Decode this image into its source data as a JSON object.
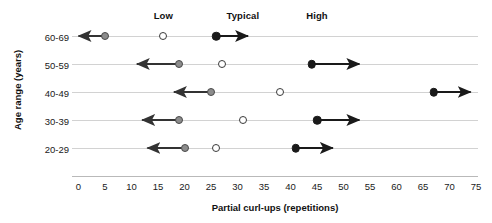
{
  "chart_data": {
    "type": "scatter",
    "title": "",
    "xlabel": "Partial curl-ups (repetitions)",
    "ylabel": "Age range (years)",
    "xlim": [
      0,
      75
    ],
    "xticks": [
      0,
      5,
      10,
      15,
      20,
      25,
      30,
      35,
      40,
      45,
      50,
      55,
      60,
      65,
      70,
      75
    ],
    "xtick_labels": [
      "0",
      "5",
      "10",
      "15",
      "20",
      "25",
      "30",
      "35",
      "40",
      "45",
      "50",
      "55",
      "60",
      "65",
      "70",
      "75"
    ],
    "categories": [
      "60-69",
      "50-59",
      "40-49",
      "30-39",
      "20-29"
    ],
    "grid": true,
    "legend_position": "top",
    "legend": [
      {
        "key": "low",
        "label": "Low",
        "marker": "filled-gray-circle",
        "arrow": "left",
        "color": "#8c8c8c"
      },
      {
        "key": "typical",
        "label": "Typical",
        "marker": "open-circle",
        "arrow": "none",
        "color": "#ffffff"
      },
      {
        "key": "high",
        "label": "High",
        "marker": "filled-black-circle",
        "arrow": "right",
        "color": "#1a1a1a"
      }
    ],
    "series": [
      {
        "name": "Low",
        "values": [
          5,
          19,
          25,
          19,
          20
        ]
      },
      {
        "name": "Typical",
        "values": [
          16,
          27,
          38,
          31,
          26
        ]
      },
      {
        "name": "High",
        "values": [
          26,
          44,
          67,
          45,
          41
        ]
      }
    ],
    "arrow_ends": {
      "low": [
        0,
        11,
        18,
        12,
        13
      ],
      "high": [
        32,
        53,
        74,
        53,
        48
      ]
    },
    "rows": [
      {
        "age": "60-69",
        "low": 5,
        "low_arrow_to": 0,
        "typical": 16,
        "high": 26,
        "high_arrow_to": 32
      },
      {
        "age": "50-59",
        "low": 19,
        "low_arrow_to": 11,
        "typical": 27,
        "high": 44,
        "high_arrow_to": 53
      },
      {
        "age": "40-49",
        "low": 25,
        "low_arrow_to": 18,
        "typical": 38,
        "high": 67,
        "high_arrow_to": 74
      },
      {
        "age": "30-39",
        "low": 19,
        "low_arrow_to": 12,
        "typical": 31,
        "high": 45,
        "high_arrow_to": 53
      },
      {
        "age": "20-29",
        "low": 20,
        "low_arrow_to": 13,
        "typical": 26,
        "high": 41,
        "high_arrow_to": 48
      }
    ],
    "legend_positions_x": {
      "low": 16,
      "typical": 31,
      "high": 45
    },
    "colors": {
      "low_fill": "#8c8c8c",
      "low_stroke": "#4a4a4a",
      "typical_fill": "#ffffff",
      "typical_stroke": "#3a3a3a",
      "high_fill": "#1a1a1a",
      "gridline": "#d2d2d2",
      "axis": "#b9b9b9",
      "text": "#111111",
      "background": "#ffffff"
    }
  }
}
